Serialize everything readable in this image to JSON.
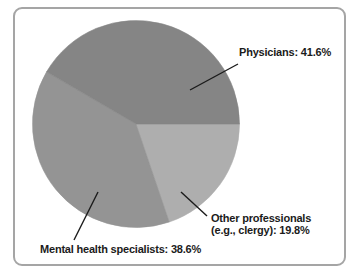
{
  "chart_data": {
    "type": "pie",
    "title": "",
    "legend_position": "none",
    "start_angle": "3 o'clock, slices drawn clockwise",
    "slices": [
      {
        "id": "other-professionals",
        "label": "Other professionals (e.g., clergy)",
        "value": 19.8,
        "color": "#aeaeae"
      },
      {
        "id": "mental-health-specialists",
        "label": "Mental health specialists",
        "value": 38.6,
        "color": "#949494"
      },
      {
        "id": "physicians",
        "label": "Physicians",
        "value": 41.6,
        "color": "#858585"
      }
    ],
    "annotations": {
      "physicians": {
        "text": "Physicians: 41.6%"
      },
      "other": {
        "line1": "Other professionals",
        "line2": "(e.g., clergy): 19.8%"
      },
      "mental": {
        "text": "Mental health specialists: 38.6%"
      }
    }
  },
  "colors": {
    "frame_border": "#a5a5a5",
    "background": "#ffffff",
    "text": "#1b1b1b",
    "leader_line": "#1b1b1b"
  }
}
